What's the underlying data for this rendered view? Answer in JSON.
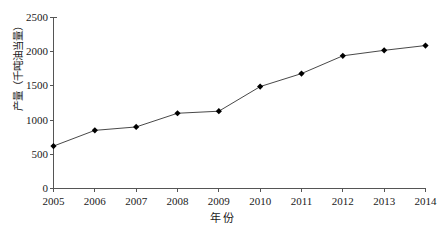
{
  "chart_data": {
    "type": "line",
    "title": "",
    "subtitle": "",
    "xlabel": "年 份",
    "ylabel": "产量（千吨油当量）",
    "categories": [
      "2005",
      "2006",
      "2007",
      "2008",
      "2009",
      "2010",
      "2011",
      "2012",
      "2013",
      "2014"
    ],
    "x": [
      2005,
      2006,
      2007,
      2008,
      2009,
      2010,
      2011,
      2012,
      2013,
      2014
    ],
    "values": [
      620,
      850,
      900,
      1100,
      1130,
      1490,
      1680,
      1940,
      2020,
      2090
    ],
    "series": [
      {
        "name": "产量",
        "values": [
          620,
          850,
          900,
          1100,
          1130,
          1490,
          1680,
          1940,
          2020,
          2090
        ]
      }
    ],
    "xlim": [
      2005,
      2014
    ],
    "ylim": [
      0,
      2500
    ],
    "ytick_labels": [
      "0",
      "500",
      "1000",
      "1500",
      "2000",
      "2500"
    ],
    "ytick_values": [
      0,
      500,
      1000,
      1500,
      2000,
      2500
    ],
    "xtick_labels": [
      "2005",
      "2006",
      "2007",
      "2008",
      "2009",
      "2010",
      "2011",
      "2012",
      "2013",
      "2014"
    ],
    "grid": false,
    "legend": false,
    "legend_position": "none",
    "marker": "diamond",
    "line_color": "#333333",
    "marker_color": "#000000",
    "axis_color": "#555555",
    "background_color": "#ffffff"
  },
  "axes": {
    "y_title": "产量（千吨油当量）",
    "x_title": "年 份",
    "y_ticks": [
      {
        "label": "2500",
        "value": 2500
      },
      {
        "label": "2000",
        "value": 2000
      },
      {
        "label": "1500",
        "value": 1500
      },
      {
        "label": "1000",
        "value": 1000
      },
      {
        "label": "500",
        "value": 500
      },
      {
        "label": "0",
        "value": 0
      }
    ],
    "x_ticks": [
      {
        "label": "2005",
        "value": 2005
      },
      {
        "label": "2006",
        "value": 2006
      },
      {
        "label": "2007",
        "value": 2007
      },
      {
        "label": "2008",
        "value": 2008
      },
      {
        "label": "2009",
        "value": 2009
      },
      {
        "label": "2010",
        "value": 2010
      },
      {
        "label": "2011",
        "value": 2011
      },
      {
        "label": "2012",
        "value": 2012
      },
      {
        "label": "2013",
        "value": 2013
      },
      {
        "label": "2014",
        "value": 2014
      }
    ]
  }
}
